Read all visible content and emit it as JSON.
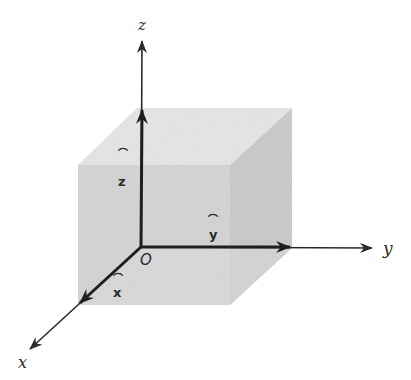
{
  "figure": {
    "axes": {
      "x": {
        "label": "x"
      },
      "y": {
        "label": "y"
      },
      "z": {
        "label": "z"
      }
    },
    "unit_vectors": {
      "x_hat": {
        "label": "x",
        "hat": "⌒"
      },
      "y_hat": {
        "label": "y",
        "hat": "⌒"
      },
      "z_hat": {
        "label": "z",
        "hat": "⌒"
      }
    },
    "origin": {
      "label": "O"
    },
    "colors": {
      "axis": "#2a2a2a",
      "cube_front": "#d2d2d2",
      "cube_top": "#e4e4e4",
      "cube_side": "#c6c6c6",
      "background": "#ffffff"
    }
  }
}
